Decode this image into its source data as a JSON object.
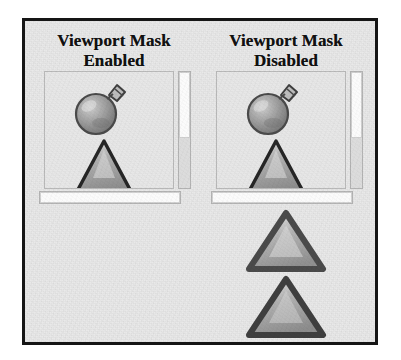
{
  "figure": {
    "background_color": "#e9e9e9",
    "frame_color": "#151515",
    "panels": [
      {
        "id": "viewport-mask-enabled",
        "title_line1": "Viewport Mask",
        "title_line2": "Enabled",
        "viewport": {
          "sprites": [
            {
              "name": "bomb-sprite",
              "label": "bomb"
            },
            {
              "name": "triangle-sprite",
              "label": "triangle"
            }
          ],
          "scrollbar_vertical": {
            "name": "vertical-scrollbar",
            "thumb_label": "scroll thumb"
          },
          "scrollbar_horizontal": {
            "name": "horizontal-scrollbar",
            "thumb_label": "scroll thumb"
          }
        },
        "overflow_sprites": []
      },
      {
        "id": "viewport-mask-disabled",
        "title_line1": "Viewport Mask",
        "title_line2": "Disabled",
        "viewport": {
          "sprites": [
            {
              "name": "bomb-sprite",
              "label": "bomb"
            },
            {
              "name": "triangle-sprite",
              "label": "triangle"
            }
          ],
          "scrollbar_vertical": {
            "name": "vertical-scrollbar",
            "thumb_label": "scroll thumb"
          },
          "scrollbar_horizontal": {
            "name": "horizontal-scrollbar",
            "thumb_label": "scroll thumb"
          }
        },
        "overflow_sprites": [
          {
            "name": "overflow-triangle-1",
            "label": "triangle"
          },
          {
            "name": "overflow-triangle-2",
            "label": "triangle"
          }
        ]
      }
    ],
    "colors": {
      "triangle_outline": "#3a3a3a",
      "triangle_fill_light": "#d6d6d6",
      "triangle_fill_dark": "#8d8d8d",
      "bomb_body": "#9a9a9a",
      "bomb_outline": "#4a4a4a",
      "scrollbar_track": "#dcdcdc",
      "scrollbar_thumb": "#fbfbfb",
      "viewport_border": "#b9b9b9"
    }
  }
}
